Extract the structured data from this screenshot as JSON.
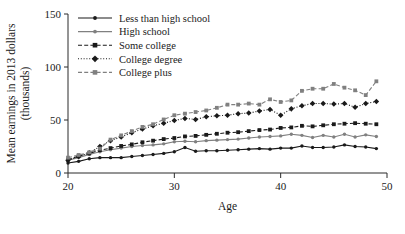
{
  "chart_data": {
    "type": "line",
    "title": "",
    "xlabel": "Age",
    "ylabel": "Mean earnings in 2013 dollars (thousands)",
    "ylabel_line1": "Mean earnings in 2013 dollars",
    "ylabel_line2": "(thousands)",
    "xlim": [
      20,
      50
    ],
    "ylim": [
      0,
      150
    ],
    "xticks": [
      20,
      30,
      40,
      50
    ],
    "xtick_labels": [
      "20",
      "30",
      "40",
      "50"
    ],
    "yticks": [
      0,
      50,
      100,
      150
    ],
    "ytick_labels": [
      "0",
      "50",
      "100",
      "150"
    ],
    "grid": false,
    "legend_position": "top-left",
    "x": [
      20,
      21,
      22,
      23,
      24,
      25,
      26,
      27,
      28,
      29,
      30,
      31,
      32,
      33,
      34,
      35,
      36,
      37,
      38,
      39,
      40,
      41,
      42,
      43,
      44,
      45,
      46,
      47,
      48,
      49
    ],
    "series": [
      {
        "name": "Less than high school",
        "color": "#1a1a1a",
        "line_style": "solid",
        "marker": "circle",
        "values": [
          9.5,
          11,
          13.5,
          14.5,
          14.5,
          14.5,
          15.5,
          16.5,
          17.5,
          18.5,
          20,
          24,
          20.5,
          21,
          21,
          21.5,
          22,
          22.5,
          23,
          22.5,
          23.5,
          23.5,
          25.5,
          24,
          24,
          24.5,
          26.5,
          25,
          24.5,
          23
        ]
      },
      {
        "name": "High school",
        "color": "#808080",
        "line_style": "solid",
        "marker": "circle",
        "values": [
          12,
          14.5,
          17.5,
          20,
          22,
          23.5,
          25,
          26,
          26.5,
          27.5,
          29.5,
          30,
          29.5,
          30.5,
          31,
          31.5,
          32,
          33,
          34,
          34.5,
          35,
          36.5,
          35.5,
          33.5,
          35.5,
          34,
          36.5,
          34,
          36,
          34.5
        ]
      },
      {
        "name": "Some college",
        "color": "#1a1a1a",
        "line_style": "dashed",
        "marker": "square",
        "values": [
          12.5,
          16,
          18.5,
          21.5,
          23.5,
          25.5,
          27,
          29,
          30.5,
          32,
          33,
          34.5,
          35,
          36,
          37,
          38,
          38.5,
          39.5,
          40.5,
          41,
          42.5,
          43,
          44.5,
          44,
          45,
          46,
          46.5,
          47,
          46.5,
          46
        ]
      },
      {
        "name": "College degree",
        "color": "#1a1a1a",
        "line_style": "dotted",
        "marker": "diamond",
        "values": [
          12,
          15.5,
          19,
          25,
          30.5,
          34,
          38,
          41.5,
          44.5,
          47,
          49.5,
          51.5,
          50.5,
          53,
          54,
          54.5,
          56,
          56.5,
          58.5,
          60,
          54.5,
          60.5,
          63.5,
          65.5,
          65.5,
          65,
          65.5,
          62,
          65.5,
          67.5
        ]
      },
      {
        "name": "College plus",
        "color": "#808080",
        "line_style": "dashed",
        "marker": "square",
        "values": [
          14.5,
          17,
          19.5,
          23,
          31.5,
          35.5,
          39.5,
          43.5,
          46,
          50.5,
          54.5,
          56,
          57.5,
          59,
          61.5,
          64.5,
          64.5,
          65.5,
          64.5,
          69.5,
          67,
          68.5,
          77.5,
          79.5,
          79.5,
          84,
          80.5,
          78,
          73.5,
          86.5
        ]
      }
    ]
  }
}
